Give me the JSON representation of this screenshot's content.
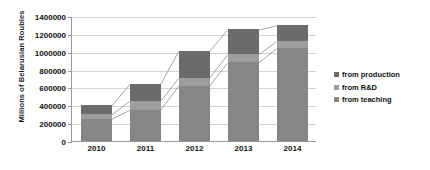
{
  "chart_data": {
    "type": "bar",
    "subtype": "stacked-column",
    "title": "",
    "xlabel": "",
    "ylabel": "Millions of Belarusian Roubles",
    "categories": [
      "2010",
      "2011",
      "2012",
      "2013",
      "2014"
    ],
    "ylim": [
      0,
      1400000
    ],
    "yticks": [
      0,
      200000,
      400000,
      600000,
      800000,
      1000000,
      1200000,
      1400000
    ],
    "ytick_labels": [
      "0",
      "200000",
      "400000",
      "600000",
      "800000",
      "1000000",
      "1200000",
      "1400000"
    ],
    "grid": true,
    "legend_position": "right",
    "series": [
      {
        "name": "from teaching",
        "color": "#868686",
        "values": [
          250000,
          350000,
          620000,
          880000,
          1040000
        ]
      },
      {
        "name": "from R&D",
        "color": "#9d9d9d",
        "values": [
          50000,
          100000,
          90000,
          90000,
          80000
        ]
      },
      {
        "name": "from production",
        "color": "#6b6b6b",
        "values": [
          100000,
          190000,
          300000,
          280000,
          180000
        ]
      }
    ],
    "totals": [
      400000,
      640000,
      1010000,
      1250000,
      1300000
    ],
    "series_lines": true
  },
  "legend": {
    "items": [
      {
        "label": "from production",
        "color": "#6b6b6b"
      },
      {
        "label": "from R&D",
        "color": "#9d9d9d"
      },
      {
        "label": "from teaching",
        "color": "#868686"
      }
    ]
  },
  "axis": {
    "y_title": "Millions of Belarusian Roubles"
  }
}
